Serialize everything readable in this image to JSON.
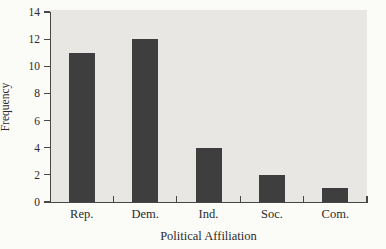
{
  "chart_data": {
    "type": "bar",
    "title": "",
    "categories": [
      "Rep.",
      "Dem.",
      "Ind.",
      "Soc.",
      "Com."
    ],
    "values": [
      11,
      12,
      4,
      2,
      1
    ],
    "xlabel": "Political Affiliation",
    "ylabel": "Frequency",
    "ylim": [
      0,
      14
    ],
    "yticks": [
      0,
      2,
      4,
      6,
      8,
      10,
      12,
      14
    ],
    "grid": false,
    "legend": false,
    "layout": {
      "plot_left": 50,
      "plot_top": 12,
      "plot_width": 317,
      "plot_height": 190,
      "bar_width": 26,
      "ytick_length": 6,
      "xtick_length": 6
    },
    "colors": {
      "bar": "#3e3e3e",
      "plot_bg": "#e8e7e3",
      "figure_bg": "#fbfbf8",
      "axis": "#474747",
      "text": "#2b2b2b"
    }
  }
}
